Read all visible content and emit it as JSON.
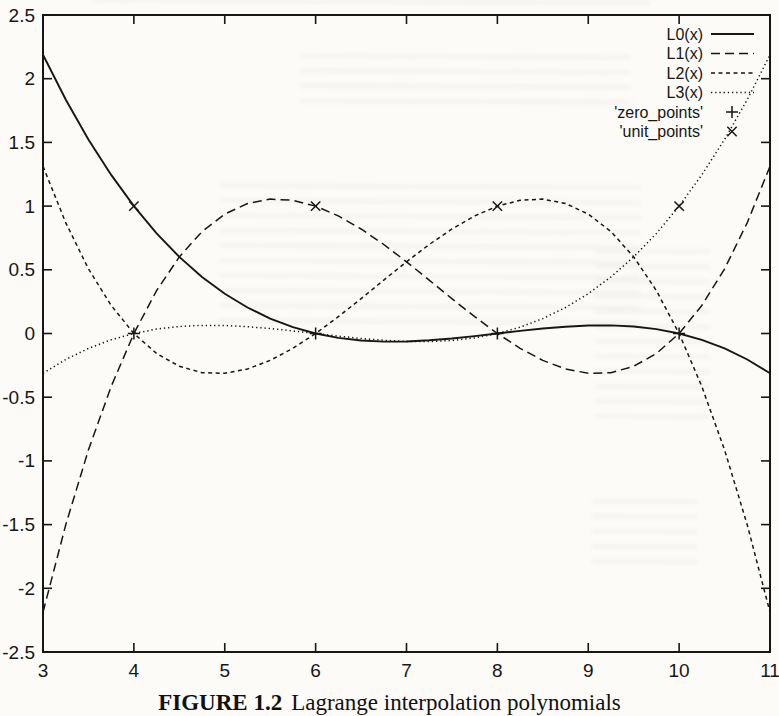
{
  "page": {
    "background": "#fcfbf8",
    "ink_color": "#161616",
    "caption": {
      "prefix": "FIGURE 1.2",
      "text": "Lagrange interpolation polynomials"
    }
  },
  "chart_data": {
    "type": "line",
    "title": "",
    "xlabel": "",
    "ylabel": "",
    "xlim": [
      3,
      11
    ],
    "ylim": [
      -2.5,
      2.5
    ],
    "grid": false,
    "legend_position": "top-right-inside",
    "x_ticks": [
      "3",
      "4",
      "5",
      "6",
      "7",
      "8",
      "9",
      "10",
      "11"
    ],
    "x_tick_values": [
      3,
      4,
      5,
      6,
      7,
      8,
      9,
      10,
      11
    ],
    "y_ticks": [
      "-2.5",
      "-2",
      "-1.5",
      "-1",
      "-0.5",
      "0",
      "0.5",
      "1",
      "1.5",
      "2",
      "2.5"
    ],
    "y_tick_values": [
      -2.5,
      -2,
      -1.5,
      -1,
      -0.5,
      0,
      0.5,
      1,
      1.5,
      2,
      2.5
    ],
    "x_start": 3,
    "x_step": 0.25,
    "series": [
      {
        "name": "L0(x)",
        "style": "solid",
        "values": [
          2.1875,
          1.8369,
          1.5234,
          1.2451,
          1.0,
          0.7861,
          0.6016,
          0.4443,
          0.3125,
          0.2041,
          0.1172,
          0.0498,
          0.0,
          -0.0342,
          -0.0547,
          -0.0635,
          -0.0625,
          -0.0537,
          -0.0391,
          -0.0205,
          0.0,
          0.0205,
          0.0391,
          0.0537,
          0.0625,
          0.0635,
          0.0547,
          0.0342,
          0.0,
          -0.0498,
          -0.1172,
          -0.2041,
          -0.3125
        ]
      },
      {
        "name": "L1(x)",
        "style": "long-dash",
        "values": [
          -2.1875,
          -1.5029,
          -0.9141,
          -0.415,
          0.0,
          0.3369,
          0.6016,
          0.7998,
          0.9375,
          1.0205,
          1.0547,
          1.0459,
          1.0,
          0.9229,
          0.8203,
          0.6982,
          0.5625,
          0.4189,
          0.2734,
          0.1318,
          0.0,
          -0.1162,
          -0.2109,
          -0.2783,
          -0.3125,
          -0.3076,
          -0.2578,
          -0.1572,
          0.0,
          0.2197,
          0.5078,
          0.8701,
          1.3125
        ]
      },
      {
        "name": "L2(x)",
        "style": "short-dash",
        "values": [
          1.3125,
          0.8701,
          0.5078,
          0.2197,
          0.0,
          -0.1572,
          -0.2578,
          -0.3076,
          -0.3125,
          -0.2783,
          -0.2109,
          -0.1162,
          0.0,
          0.1318,
          0.2734,
          0.4189,
          0.5625,
          0.6982,
          0.8203,
          0.9229,
          1.0,
          1.0459,
          1.0547,
          1.0205,
          0.9375,
          0.7998,
          0.6016,
          0.3369,
          0.0,
          -0.415,
          -0.9141,
          -1.5029,
          -2.1875
        ]
      },
      {
        "name": "L3(x)",
        "style": "dotted",
        "values": [
          -0.3125,
          -0.2041,
          -0.1172,
          -0.0498,
          0.0,
          0.0342,
          0.0547,
          0.0635,
          0.0625,
          0.0537,
          0.0391,
          0.0205,
          0.0,
          -0.0205,
          -0.0391,
          -0.0537,
          -0.0625,
          -0.0635,
          -0.0547,
          -0.0342,
          0.0,
          0.0498,
          0.1172,
          0.2041,
          0.3125,
          0.4443,
          0.6016,
          0.7861,
          1.0,
          1.2451,
          1.5234,
          1.8369,
          2.1875
        ]
      }
    ],
    "point_sets": [
      {
        "name": "'zero_points'",
        "marker": "plus",
        "points": [
          [
            4,
            0
          ],
          [
            6,
            0
          ],
          [
            8,
            0
          ],
          [
            10,
            0
          ]
        ]
      },
      {
        "name": "'unit_points'",
        "marker": "cross",
        "points": [
          [
            4,
            1
          ],
          [
            6,
            1
          ],
          [
            8,
            1
          ],
          [
            10,
            1
          ]
        ]
      }
    ]
  }
}
